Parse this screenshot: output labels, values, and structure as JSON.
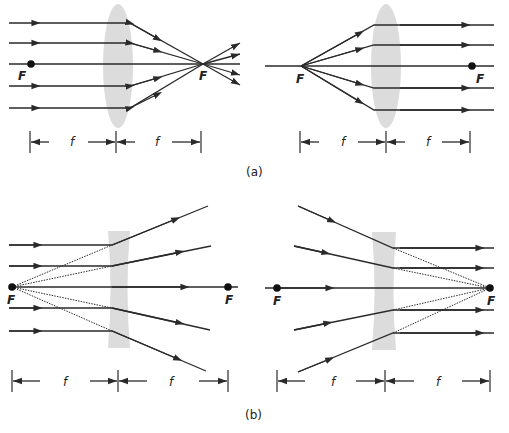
{
  "figure": {
    "panel_a": {
      "caption": "(a)",
      "left": {
        "description": "converging lens: parallel rays focus to F",
        "focal_label_left": "F",
        "focal_label_right": "F",
        "dim_label_1": "f",
        "dim_label_2": "f"
      },
      "right": {
        "description": "converging lens: rays from F exit parallel",
        "focal_label_left": "F",
        "focal_label_right": "F",
        "dim_label_1": "f",
        "dim_label_2": "f"
      }
    },
    "panel_b": {
      "caption": "(b)",
      "left": {
        "description": "diverging lens: parallel rays diverge as if from F",
        "focal_label_left": "F",
        "focal_label_right": "F",
        "dim_label_1": "f",
        "dim_label_2": "f"
      },
      "right": {
        "description": "diverging lens: rays aimed at F exit parallel",
        "focal_label_left": "F",
        "focal_label_right": "F",
        "dim_label_1": "f",
        "dim_label_2": "f"
      }
    },
    "colors": {
      "ray": "#2a2a2a",
      "lens": "#dcdcdc",
      "background": "#ffffff"
    }
  }
}
